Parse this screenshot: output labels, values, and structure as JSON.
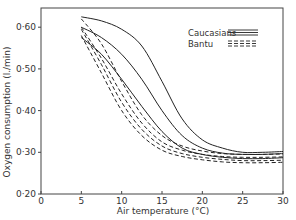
{
  "chart_data": {
    "type": "line",
    "title": "",
    "xlabel": "Air temperature (°C)",
    "ylabel": "Oxygen consumption (l./min)",
    "xlim": [
      0,
      30
    ],
    "ylim": [
      0.2,
      0.65
    ],
    "xticks": [
      0,
      5,
      10,
      15,
      20,
      25,
      30
    ],
    "xtick_labels": [
      "0",
      "5",
      "10",
      "15",
      "20",
      "25",
      "30"
    ],
    "yticks": [
      0.2,
      0.3,
      0.4,
      0.5,
      0.6
    ],
    "ytick_labels": [
      "0·20",
      "0·30",
      "0·40",
      "0·50",
      "0·60"
    ],
    "grid": false,
    "legend": {
      "position": "upper right",
      "entries": [
        {
          "label": "Caucasians",
          "style": "solid"
        },
        {
          "label": "Bantu",
          "style": "dashed"
        }
      ]
    },
    "x": [
      5,
      7.5,
      10,
      12.5,
      15,
      17.5,
      20,
      22.5,
      25,
      27.5,
      30
    ],
    "series": [
      {
        "name": "Caucasians 1",
        "group": "Caucasians",
        "style": "solid",
        "values": [
          0.625,
          0.615,
          0.595,
          0.555,
          0.47,
          0.38,
          0.33,
          0.31,
          0.3,
          0.3,
          0.302
        ]
      },
      {
        "name": "Caucasians 2",
        "group": "Caucasians",
        "style": "solid",
        "values": [
          0.6,
          0.575,
          0.535,
          0.475,
          0.4,
          0.34,
          0.31,
          0.298,
          0.295,
          0.295,
          0.297
        ]
      },
      {
        "name": "Caucasians 3",
        "group": "Caucasians",
        "style": "solid",
        "values": [
          0.575,
          0.535,
          0.475,
          0.41,
          0.35,
          0.31,
          0.295,
          0.288,
          0.285,
          0.285,
          0.287
        ]
      },
      {
        "name": "Bantu 1",
        "group": "Bantu",
        "style": "dashed",
        "values": [
          0.62,
          0.56,
          0.47,
          0.39,
          0.34,
          0.315,
          0.303,
          0.297,
          0.295,
          0.295,
          0.296
        ]
      },
      {
        "name": "Bantu 2",
        "group": "Bantu",
        "style": "dashed",
        "values": [
          0.6,
          0.525,
          0.44,
          0.37,
          0.325,
          0.305,
          0.295,
          0.29,
          0.288,
          0.288,
          0.289
        ]
      },
      {
        "name": "Bantu 3",
        "group": "Bantu",
        "style": "dashed",
        "values": [
          0.595,
          0.51,
          0.42,
          0.355,
          0.315,
          0.297,
          0.288,
          0.283,
          0.28,
          0.28,
          0.281
        ]
      },
      {
        "name": "Bantu 4",
        "group": "Bantu",
        "style": "dashed",
        "values": [
          0.58,
          0.49,
          0.4,
          0.34,
          0.305,
          0.29,
          0.282,
          0.277,
          0.275,
          0.275,
          0.276
        ]
      }
    ]
  }
}
